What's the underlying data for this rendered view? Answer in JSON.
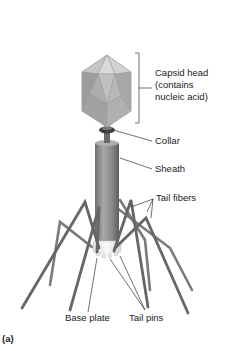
{
  "figure": {
    "panel_label": "(a)",
    "labels": {
      "capsid_line1": "Capsid head",
      "capsid_line2": "(contains",
      "capsid_line3": "nucleic acid)",
      "collar": "Collar",
      "sheath": "Sheath",
      "tail_fibers": "Tail fibers",
      "base_plate": "Base plate",
      "tail_pins": "Tail pins"
    },
    "colors": {
      "capsid_light": "#c8c8c8",
      "capsid_dark": "#8a8a8a",
      "sheath": "#8c8c8c",
      "fiber": "#6e6e6e",
      "baseplate": "#ececec",
      "text": "#222222"
    }
  }
}
